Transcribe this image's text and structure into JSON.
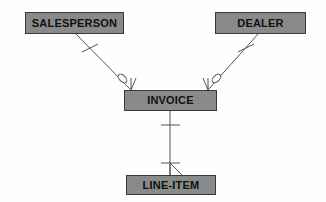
{
  "diagram": {
    "notation": "crow's-foot",
    "background_color": "#fefefe",
    "entity_fill_color": "#8a8a8a",
    "entity_border_color": "#3a3a3a",
    "line_color": "#555555",
    "entities": [
      {
        "id": "salesperson",
        "label": "SALESPERSON",
        "x": 25,
        "y": 12,
        "width": 99,
        "height": 22
      },
      {
        "id": "dealer",
        "label": "DEALER",
        "x": 215,
        "y": 12,
        "width": 91,
        "height": 22
      },
      {
        "id": "invoice",
        "label": "INVOICE",
        "x": 124,
        "y": 90,
        "width": 93,
        "height": 21
      },
      {
        "id": "line_item",
        "label": "LINE-ITEM",
        "x": 126,
        "y": 175,
        "width": 90,
        "height": 20
      }
    ],
    "relationships": [
      {
        "id": "salesperson-invoice",
        "from": "salesperson",
        "to": "invoice",
        "from_cardinality": "one",
        "to_cardinality": "zero-or-many"
      },
      {
        "id": "dealer-invoice",
        "from": "dealer",
        "to": "invoice",
        "from_cardinality": "one",
        "to_cardinality": "zero-or-many"
      },
      {
        "id": "invoice-line-item",
        "from": "invoice",
        "to": "line_item",
        "from_cardinality": "one",
        "to_cardinality": "many"
      }
    ]
  }
}
